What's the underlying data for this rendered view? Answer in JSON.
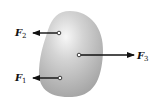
{
  "diagram": {
    "type": "free-body-diagram",
    "body": {
      "shape": "rounded-blob",
      "fill_light": "#f4f4f4",
      "fill_dark": "#a9a9a9"
    },
    "forces": [
      {
        "symbol": "F",
        "subscript": "2",
        "direction": "left",
        "position": "upper-left"
      },
      {
        "symbol": "F",
        "subscript": "3",
        "direction": "right",
        "position": "center"
      },
      {
        "symbol": "F",
        "subscript": "1",
        "direction": "left",
        "position": "lower-left"
      }
    ],
    "arrow_color": "#111111"
  }
}
